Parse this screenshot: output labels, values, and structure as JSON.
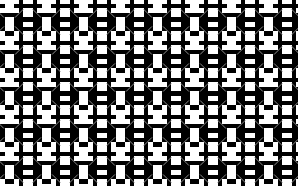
{
  "image": {
    "width": 298,
    "height": 186,
    "type": "geometric-tiling-pattern",
    "description": "Monochrome repeating ornamental lattice of blocky cross-shaped clusters with faint gray diagonal connectors",
    "background_color": "#ffffff",
    "foreground_color": "#000000",
    "accent_color": "#9a9a9a"
  },
  "pattern": {
    "tile_width": 37,
    "tile_height": 37,
    "unit_cell": 4.625,
    "origin_offset_x": -9,
    "origin_offset_y": -15,
    "clipped_edges": "all",
    "columns": 10,
    "rows": 7,
    "motif_name": "four-fold blocky cross ring",
    "stroke_color": "#9a9a9a",
    "stroke_width": 0.9,
    "block_color": "#000000",
    "blocks": [
      [
        1,
        0,
        2,
        1
      ],
      [
        0,
        1,
        1,
        1
      ],
      [
        1,
        1,
        1,
        1
      ],
      [
        2,
        1,
        1,
        1
      ],
      [
        1,
        2,
        1,
        1
      ],
      [
        5,
        0,
        2,
        1
      ],
      [
        5,
        1,
        1,
        1
      ],
      [
        6,
        1,
        1,
        1
      ],
      [
        7,
        1,
        1,
        1
      ],
      [
        6,
        2,
        1,
        1
      ],
      [
        0,
        4,
        1,
        1
      ],
      [
        1,
        4,
        1,
        1
      ],
      [
        1,
        3,
        1,
        1
      ],
      [
        1,
        5,
        1,
        1
      ],
      [
        2,
        4,
        1,
        1
      ],
      [
        5,
        4,
        1,
        1
      ],
      [
        6,
        4,
        1,
        1
      ],
      [
        6,
        3,
        1,
        1
      ],
      [
        6,
        5,
        1,
        1
      ],
      [
        7,
        4,
        1,
        1
      ],
      [
        3,
        2,
        1,
        1
      ],
      [
        4,
        2,
        1,
        1
      ],
      [
        3,
        6,
        1,
        1
      ],
      [
        4,
        6,
        1,
        1
      ],
      [
        1,
        6,
        2,
        1
      ],
      [
        1,
        7,
        1,
        1
      ],
      [
        0,
        7,
        1,
        1
      ],
      [
        2,
        7,
        1,
        1
      ],
      [
        1,
        8,
        1,
        1
      ],
      [
        5,
        6,
        2,
        1
      ],
      [
        5,
        7,
        1,
        1
      ],
      [
        6,
        7,
        1,
        1
      ],
      [
        7,
        7,
        1,
        1
      ],
      [
        6,
        8,
        1,
        1
      ]
    ],
    "diagonals": [
      {
        "x1": 0.35,
        "y1": 0.12,
        "x2": 0.12,
        "y2": 0.35
      },
      {
        "x1": 0.88,
        "y1": 0.35,
        "x2": 0.65,
        "y2": 0.12
      },
      {
        "x1": 0.12,
        "y1": 0.65,
        "x2": 0.35,
        "y2": 0.88
      },
      {
        "x1": 0.65,
        "y1": 0.88,
        "x2": 0.88,
        "y2": 0.65
      }
    ]
  }
}
